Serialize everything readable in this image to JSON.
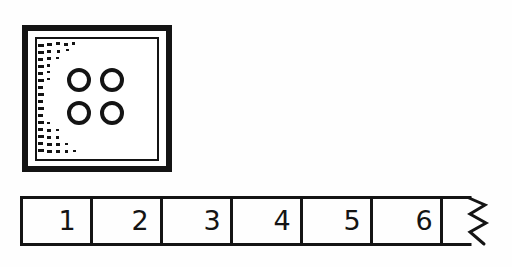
{
  "page": {
    "background_color": "#fefefe",
    "ink_color": "#141414",
    "width": 512,
    "height": 267
  },
  "box_figure": {
    "name": "framed-box-with-counters",
    "outer_frame": {
      "x": 22,
      "y": 25,
      "width": 150,
      "height": 147,
      "stroke_width": 6,
      "stroke_color": "#141414",
      "fill": "#ffffff"
    },
    "inner_rect": {
      "x": 36,
      "y": 38,
      "width": 122,
      "height": 122,
      "stroke_width": 2,
      "stroke_color": "#141414",
      "fill": "#ffffff"
    },
    "stipple": {
      "description": "column of small dark dashes along inner left edge with scattered dashes spreading right at top and bottom",
      "color": "#141414"
    },
    "counters": {
      "count": 4,
      "shape": "ring",
      "arrangement": "2x2",
      "radius": 10,
      "stroke_width": 4,
      "stroke_color": "#141414",
      "fill": "none",
      "positions": [
        {
          "cx": 79,
          "cy": 80
        },
        {
          "cx": 112,
          "cy": 80
        },
        {
          "cx": 79,
          "cy": 113
        },
        {
          "cx": 112,
          "cy": 113
        }
      ]
    }
  },
  "number_strip": {
    "name": "number-line-strip",
    "x": 20,
    "y": 196,
    "width": 472,
    "height": 50,
    "stroke_width": 3,
    "stroke_color": "#141414",
    "fill": "#ffffff",
    "cell_width": 70,
    "cells": [
      {
        "label": "1",
        "index": 0
      },
      {
        "label": "2",
        "index": 1
      },
      {
        "label": "3",
        "index": 2
      },
      {
        "label": "4",
        "index": 3
      },
      {
        "label": "5",
        "index": 4
      },
      {
        "label": "6",
        "index": 5
      }
    ],
    "continuation": {
      "type": "zigzag-torn-edge",
      "segments": 4,
      "description": "vertical zigzag line at right end indicating the strip continues"
    }
  }
}
